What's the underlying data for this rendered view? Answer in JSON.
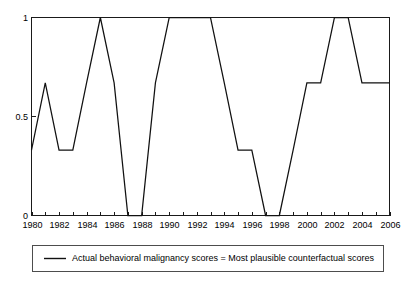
{
  "chart_data": {
    "type": "line",
    "title": "",
    "xlabel": "",
    "ylabel": "",
    "xlim": [
      1980,
      2006
    ],
    "ylim": [
      0,
      1
    ],
    "grid": false,
    "legend_position": "below-axes",
    "x": [
      1980,
      1981,
      1982,
      1983,
      1984,
      1985,
      1986,
      1987,
      1988,
      1989,
      1990,
      1991,
      1992,
      1993,
      1994,
      1995,
      1996,
      1997,
      1998,
      1999,
      2000,
      2001,
      2002,
      2003,
      2004,
      2005,
      2006
    ],
    "series": [
      {
        "name": "Actual behavioral malignancy scores = Most plausible counterfactual scores",
        "color": "#111111",
        "values": [
          0.33,
          0.67,
          0.33,
          0.33,
          0.67,
          1,
          0.67,
          0,
          0,
          0.67,
          1,
          1,
          1,
          1,
          0.67,
          0.33,
          0.33,
          0,
          0,
          0.33,
          0.67,
          0.67,
          1,
          1,
          0.67,
          0.67,
          0.67
        ]
      }
    ],
    "xticks": [
      1980,
      1981,
      1982,
      1983,
      1984,
      1985,
      1986,
      1987,
      1988,
      1989,
      1990,
      1991,
      1992,
      1993,
      1994,
      1995,
      1996,
      1997,
      1998,
      1999,
      2000,
      2001,
      2002,
      2003,
      2004,
      2005,
      2006
    ],
    "xtick_labels": [
      "1980",
      "",
      "1982",
      "",
      "1984",
      "",
      "1986",
      "",
      "1988",
      "",
      "1990",
      "",
      "1992",
      "",
      "1994",
      "",
      "1996",
      "",
      "1998",
      "",
      "2000",
      "",
      "2002",
      "",
      "2004",
      "",
      "2006"
    ],
    "yticks": [
      0,
      0.5,
      1
    ],
    "ytick_labels": [
      "0",
      "0.5",
      "1"
    ]
  },
  "legend": {
    "entries": [
      {
        "label": "Actual behavioral malignancy scores = Most plausible counterfactual scores"
      }
    ]
  },
  "axes": {
    "y_label_top": "1",
    "y_label_mid": "0.5",
    "y_label_bottom": "0"
  }
}
